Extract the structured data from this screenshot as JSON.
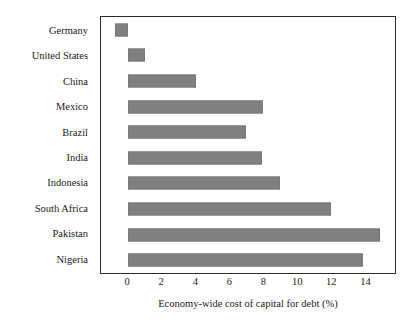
{
  "chart_data": {
    "type": "bar",
    "orientation": "horizontal",
    "title": "",
    "subtitle": "",
    "xlabel": "Economy-wide cost of capital for debt (%)",
    "ylabel": "",
    "categories": [
      "Germany",
      "United States",
      "China",
      "Mexico",
      "Brazil",
      "India",
      "Indonesia",
      "South Africa",
      "Pakistan",
      "Nigeria"
    ],
    "values": [
      -0.8,
      1.0,
      4.0,
      8.0,
      7.0,
      7.9,
      9.0,
      12.0,
      14.9,
      13.9
    ],
    "series": [
      {
        "name": "Economy-wide cost of capital for debt (%)",
        "values": [
          -0.8,
          1.0,
          4.0,
          8.0,
          7.0,
          7.9,
          9.0,
          12.0,
          14.9,
          13.9
        ]
      }
    ],
    "xticks": [
      0,
      2,
      4,
      6,
      8,
      10,
      12,
      14
    ],
    "xtick_labels": [
      "0",
      "2",
      "4",
      "6",
      "8",
      "10",
      "12",
      "14"
    ],
    "xlim": [
      -1.6,
      15.8
    ],
    "grid": false,
    "legend": false,
    "legend_position": "none",
    "bar_color": "#808080",
    "axis_color": "#2b2b2b",
    "background_color": "#ffffff"
  }
}
